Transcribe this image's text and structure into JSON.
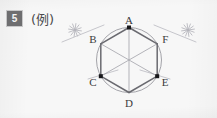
{
  "page": {
    "width": 217,
    "height": 118,
    "background_color": "#f7f7f7",
    "ink_color": "#8b8b90",
    "dark_ink_color": "#6a6a70",
    "vertex_dot_color": "#17171a",
    "label_color": "#3b3b3d"
  },
  "header": {
    "problem_number": "5",
    "badge_background": "#6e6e70",
    "badge_text_color": "#f4f4f4",
    "example_label": "(例)"
  },
  "figure": {
    "caption": "regular hexagon ABCDEF inscribed in a circle with compass construction arcs",
    "circle": {
      "center_x": 129,
      "center_y": 60,
      "radius": 32.5,
      "stroke": "#9a9aa0",
      "stroke_width": 0.9
    },
    "vertices": [
      {
        "name": "A",
        "x": 129,
        "y": 27.5,
        "dot": true,
        "label_dx": 0,
        "label_dy": -4
      },
      {
        "name": "B",
        "x": 100.8,
        "y": 43.8,
        "dot": false,
        "label_dx": -8,
        "label_dy": -1
      },
      {
        "name": "C",
        "x": 100.8,
        "y": 76.2,
        "dot": true,
        "label_dx": -8,
        "label_dy": 10
      },
      {
        "name": "D",
        "x": 129,
        "y": 92.5,
        "dot": false,
        "label_dx": 0,
        "label_dy": 14
      },
      {
        "name": "E",
        "x": 157.2,
        "y": 76.2,
        "dot": true,
        "label_dx": 8,
        "label_dy": 10
      },
      {
        "name": "F",
        "x": 157.2,
        "y": 43.8,
        "dot": false,
        "label_dx": 8,
        "label_dy": -1
      }
    ],
    "hexagon_edges": [
      {
        "from": "A",
        "to": "B",
        "weight": "heavy"
      },
      {
        "from": "B",
        "to": "C",
        "weight": "heavy"
      },
      {
        "from": "C",
        "to": "D",
        "weight": "heavy"
      },
      {
        "from": "D",
        "to": "E",
        "weight": "heavy"
      },
      {
        "from": "E",
        "to": "F",
        "weight": "heavy"
      },
      {
        "from": "F",
        "to": "A",
        "weight": "heavy"
      }
    ],
    "diagonals": [
      {
        "from": "A",
        "to": "D",
        "weight": "light"
      },
      {
        "from": "B",
        "to": "E",
        "weight": "light"
      },
      {
        "from": "C",
        "to": "F",
        "weight": "light"
      }
    ],
    "construction_marks": [
      {
        "name": "arc-cross-left",
        "x": 75,
        "y": 30,
        "size": 13,
        "rotation": 8
      },
      {
        "name": "arc-cross-right",
        "x": 188,
        "y": 30,
        "size": 13,
        "rotation": -8
      }
    ],
    "construction_rays": [
      {
        "from_x": 62,
        "from_y": 42,
        "to_x": 104,
        "to_y": 25
      },
      {
        "from_x": 196,
        "from_y": 42,
        "to_x": 154,
        "to_y": 25
      },
      {
        "from_x": 88,
        "from_y": 79,
        "to_x": 118,
        "to_y": 70
      },
      {
        "from_x": 170,
        "from_y": 79,
        "to_x": 140,
        "to_y": 70
      }
    ]
  }
}
